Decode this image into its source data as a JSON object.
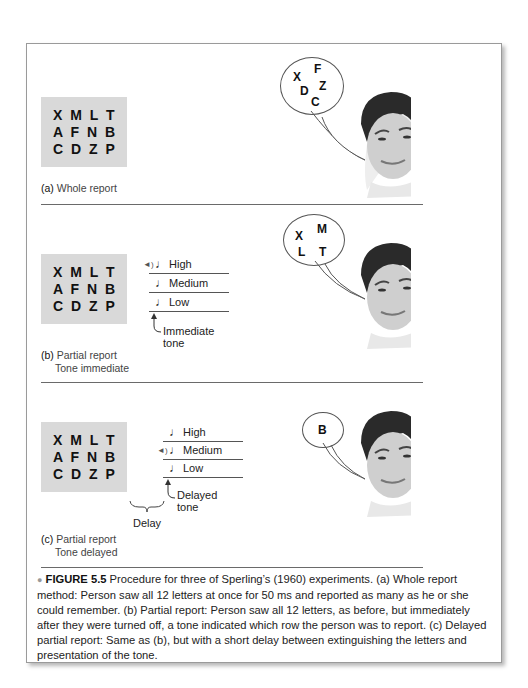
{
  "panels": [
    {
      "id": "a",
      "grid_rows": [
        "X M L T",
        "A F N B",
        "C D Z P"
      ],
      "caption_label": "(a)",
      "caption_line1": "Whole report",
      "caption_line2": "",
      "bubble_letters": [
        "X",
        "F",
        "D",
        "Z",
        "C"
      ]
    },
    {
      "id": "b",
      "grid_rows": [
        "X M L T",
        "A F N B",
        "C D Z P"
      ],
      "tones": [
        "High",
        "Medium",
        "Low"
      ],
      "tone_arrow_label": "Immediate tone",
      "caption_label": "(b)",
      "caption_line1": "Partial report",
      "caption_line2": "Tone immediate",
      "bubble_letters": [
        "X",
        "M",
        "L",
        "T"
      ]
    },
    {
      "id": "c",
      "grid_rows": [
        "X M L T",
        "A F N B",
        "C D Z P"
      ],
      "tones": [
        "High",
        "Medium",
        "Low"
      ],
      "tone_arrow_label": "Delayed tone",
      "delay_label": "Delay",
      "caption_label": "(c)",
      "caption_line1": "Partial report",
      "caption_line2": "Tone delayed",
      "bubble_letters": [
        "B"
      ]
    }
  ],
  "figure_caption": {
    "bullet": "●",
    "label": "FIGURE 5.5",
    "text": "Procedure for three of Sperling’s (1960) experiments. (a) Whole report method: Person saw all 12 letters at once for 50 ms and reported as many as he or she could remember. (b) Partial report: Person saw all 12 letters, as before, but immediately after they were turned off, a tone indicated which row the person was to report.  (c) Delayed partial report: Same as (b), but with a short delay between extinguishing the letters and presentation of the tone."
  }
}
